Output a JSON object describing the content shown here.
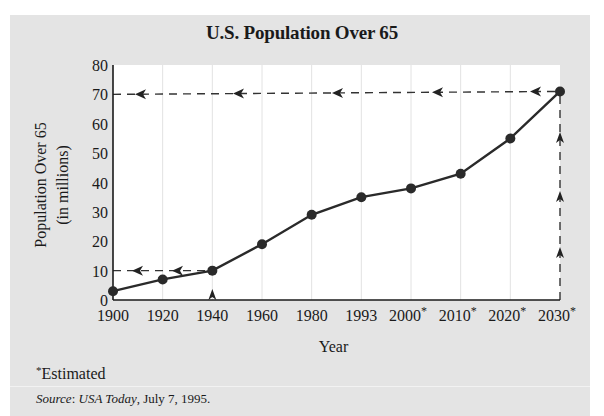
{
  "chart_data": {
    "type": "line",
    "title": "U.S. Population Over 65",
    "xlabel": "Year",
    "ylabel": [
      "Population Over 65",
      "(in millions)"
    ],
    "categories": [
      "1900",
      "1920",
      "1940",
      "1960",
      "1980",
      "1993",
      "2000",
      "2010",
      "2020",
      "2030"
    ],
    "estimated": [
      false,
      false,
      false,
      false,
      false,
      false,
      true,
      true,
      true,
      true
    ],
    "values": [
      3,
      7,
      10,
      19,
      29,
      35,
      38,
      43,
      55,
      71
    ],
    "ylim": [
      0,
      80
    ],
    "yticks": [
      0,
      10,
      20,
      30,
      40,
      50,
      60,
      70,
      80
    ],
    "grid": "vertical-faint",
    "annotations": [
      {
        "type": "dashed-guide",
        "from": "1940 on x-axis",
        "to": "1940 point, then left to y=10"
      },
      {
        "type": "dashed-guide",
        "from": "2030 on x-axis",
        "to": "2030 point, then left to y=70"
      }
    ]
  },
  "footnote": {
    "marker": "*",
    "text": "Estimated"
  },
  "source": {
    "label": "Source",
    "publication": "USA Today",
    "date": ", July 7, 1995."
  }
}
